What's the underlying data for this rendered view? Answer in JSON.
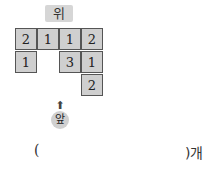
{
  "labels": {
    "top": "위",
    "front": "앞",
    "arrow": "⬆"
  },
  "grid": {
    "cells": [
      {
        "row": 0,
        "col": 0,
        "value": "2"
      },
      {
        "row": 0,
        "col": 1,
        "value": "1"
      },
      {
        "row": 0,
        "col": 2,
        "value": "1"
      },
      {
        "row": 0,
        "col": 3,
        "value": "2"
      },
      {
        "row": 1,
        "col": 0,
        "value": "1"
      },
      {
        "row": 1,
        "col": 2,
        "value": "3"
      },
      {
        "row": 1,
        "col": 3,
        "value": "1"
      },
      {
        "row": 2,
        "col": 3,
        "value": "2"
      }
    ]
  },
  "answer": {
    "open": "(",
    "close": ")개"
  }
}
